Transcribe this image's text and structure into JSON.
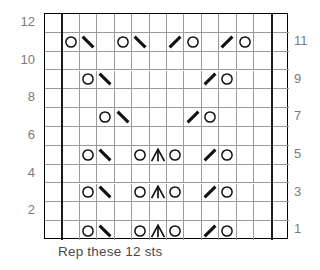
{
  "chart_data": {
    "type": "table",
    "title": "",
    "caption": "Rep these 12 sts",
    "columns": 14,
    "rows": 12,
    "repeat_stitches": 12,
    "repeat_start_column": 2,
    "repeat_end_column": 13,
    "row_labels_left": [
      "12",
      "10",
      "8",
      "6",
      "4",
      "2"
    ],
    "row_labels_right": [
      "11",
      "9",
      "7",
      "5",
      "3",
      "1"
    ],
    "left_label_rows": [
      12,
      10,
      8,
      6,
      4,
      2
    ],
    "right_label_rows": [
      11,
      9,
      7,
      5,
      3,
      1
    ],
    "symbol_legend": {
      "o": "yarn-over",
      "\\": "k2tog-right-leaning-decrease",
      "/": "ssk-left-leaning-decrease",
      "A": "centered-double-decrease",
      "": "knit-blank"
    },
    "grid": [
      {
        "row": 12,
        "cells": [
          "",
          "",
          "",
          "",
          "",
          "",
          "",
          "",
          "",
          "",
          "",
          "",
          "",
          ""
        ]
      },
      {
        "row": 11,
        "cells": [
          "",
          "o",
          "\\",
          "",
          "o",
          "\\",
          "",
          "/",
          "o",
          "",
          "/",
          "o",
          "",
          ""
        ]
      },
      {
        "row": 10,
        "cells": [
          "",
          "",
          "",
          "",
          "",
          "",
          "",
          "",
          "",
          "",
          "",
          "",
          "",
          ""
        ]
      },
      {
        "row": 9,
        "cells": [
          "",
          "",
          "o",
          "\\",
          "",
          "",
          "",
          "",
          "",
          "/",
          "o",
          "",
          "",
          ""
        ]
      },
      {
        "row": 8,
        "cells": [
          "",
          "",
          "",
          "",
          "",
          "",
          "",
          "",
          "",
          "",
          "",
          "",
          "",
          ""
        ]
      },
      {
        "row": 7,
        "cells": [
          "",
          "",
          "",
          "o",
          "\\",
          "",
          "",
          "",
          "/",
          "o",
          "",
          "",
          "",
          ""
        ]
      },
      {
        "row": 6,
        "cells": [
          "",
          "",
          "",
          "",
          "",
          "",
          "",
          "",
          "",
          "",
          "",
          "",
          "",
          ""
        ]
      },
      {
        "row": 5,
        "cells": [
          "",
          "",
          "o",
          "\\",
          "",
          "o",
          "A",
          "o",
          "",
          "/",
          "o",
          "",
          "",
          ""
        ]
      },
      {
        "row": 4,
        "cells": [
          "",
          "",
          "",
          "",
          "",
          "",
          "",
          "",
          "",
          "",
          "",
          "",
          "",
          ""
        ]
      },
      {
        "row": 3,
        "cells": [
          "",
          "",
          "o",
          "\\",
          "",
          "o",
          "A",
          "o",
          "",
          "/",
          "o",
          "",
          "",
          ""
        ]
      },
      {
        "row": 2,
        "cells": [
          "",
          "",
          "",
          "",
          "",
          "",
          "",
          "",
          "",
          "",
          "",
          "",
          "",
          ""
        ]
      },
      {
        "row": 1,
        "cells": [
          "",
          "",
          "o",
          "\\",
          "",
          "o",
          "A",
          "o",
          "",
          "/",
          "o",
          "",
          "",
          ""
        ]
      }
    ]
  }
}
